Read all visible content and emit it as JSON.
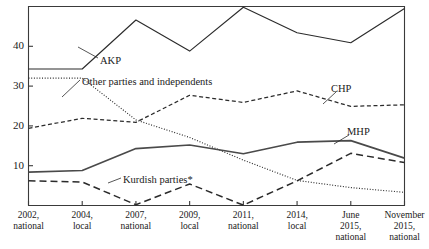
{
  "chart_data": {
    "type": "line",
    "title": "",
    "subtitle": "",
    "xlabel": "",
    "ylabel": "",
    "ylim": [
      0,
      50
    ],
    "xlim": [
      0,
      7
    ],
    "grid": false,
    "legend_position": "inline-annotations",
    "yticks": [
      10,
      20,
      30,
      40
    ],
    "ytick_labels": [
      "10",
      "20",
      "30",
      "40"
    ],
    "categories": [
      "2002, national",
      "2004, local",
      "2007, national",
      "2009, local",
      "2011, national",
      "2014, local",
      "June 2015, national",
      "November 2015, national"
    ],
    "xtick_labels": [
      [
        "2002,",
        "national"
      ],
      [
        "2004,",
        "local"
      ],
      [
        "2007,",
        "national"
      ],
      [
        "2009,",
        "local"
      ],
      [
        "2011,",
        "national"
      ],
      [
        "2014,",
        "local"
      ],
      [
        "June",
        "2015,",
        "national"
      ],
      [
        "November",
        "2015,",
        "national"
      ]
    ],
    "series": [
      {
        "name": "AKP",
        "style": "solid",
        "color": "#2b2b2b",
        "label_text": "AKP",
        "values": [
          34.3,
          34.3,
          46.6,
          38.8,
          49.8,
          43.4,
          40.9,
          49.5
        ]
      },
      {
        "name": "Other parties and independents",
        "style": "dotted",
        "color": "#2b2b2b",
        "label_text": "Other parties and independents",
        "values": [
          32.0,
          32.0,
          21.5,
          17.1,
          11.4,
          6.3,
          4.5,
          3.3
        ]
      },
      {
        "name": "CHP",
        "style": "dashed",
        "color": "#2b2b2b",
        "label_text": "CHP",
        "values": [
          19.4,
          21.9,
          20.9,
          27.7,
          25.9,
          28.8,
          24.9,
          25.3
        ]
      },
      {
        "name": "MHP",
        "style": "solid-thick",
        "color": "#4a4a4a",
        "label_text": "MHP",
        "values": [
          8.4,
          8.8,
          14.3,
          15.2,
          13.0,
          15.9,
          16.3,
          11.9
        ]
      },
      {
        "name": "Kurdish parties*",
        "style": "long-dashed",
        "color": "#2b2b2b",
        "label_text": "Kurdish parties*",
        "values": [
          6.2,
          5.9,
          0.2,
          5.4,
          0.1,
          6.2,
          13.1,
          10.8
        ]
      }
    ],
    "annotations": [
      {
        "text": "AKP",
        "x": 100,
        "y": 55
      },
      {
        "text": "Other parties and independents",
        "x": 82,
        "y": 76
      },
      {
        "text": "CHP",
        "x": 331,
        "y": 83
      },
      {
        "text": "MHP",
        "x": 347,
        "y": 126
      },
      {
        "text": "Kurdish parties*",
        "x": 123,
        "y": 174
      }
    ]
  }
}
